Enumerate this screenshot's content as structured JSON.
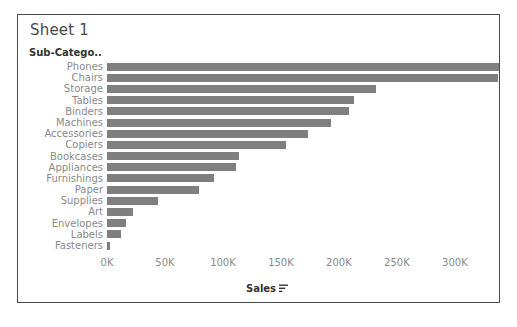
{
  "sheet": {
    "title": "Sheet 1"
  },
  "field_header": {
    "label": "Sub-Catego.."
  },
  "axis": {
    "x_title": "Sales",
    "x_sort_icon": "sort-descending-icon",
    "x_ticks": [
      "0K",
      "50K",
      "100K",
      "150K",
      "200K",
      "250K",
      "300K"
    ]
  },
  "colors": {
    "bar": "#7f7f7f",
    "frame": "#4a4a4a",
    "label": "#8a8a8a",
    "header": "#333333",
    "title": "#4a4a4a",
    "background": "#ffffff"
  },
  "chart_data": {
    "type": "bar",
    "orientation": "horizontal",
    "title": "Sheet 1",
    "xlabel": "Sales",
    "ylabel": "Sub-Catego..",
    "xlim": [
      0,
      338000
    ],
    "xtick_values": [
      0,
      50000,
      100000,
      150000,
      200000,
      250000,
      300000
    ],
    "xtick_labels": [
      "0K",
      "50K",
      "100K",
      "150K",
      "200K",
      "250K",
      "300K"
    ],
    "grid": false,
    "legend": false,
    "sort": "descending",
    "categories": [
      "Phones",
      "Chairs",
      "Storage",
      "Tables",
      "Binders",
      "Machines",
      "Accessories",
      "Copiers",
      "Bookcases",
      "Appliances",
      "Furnishings",
      "Paper",
      "Supplies",
      "Art",
      "Envelopes",
      "Labels",
      "Fasteners"
    ],
    "values": [
      338000,
      337000,
      232000,
      213000,
      209000,
      193000,
      173000,
      154000,
      114000,
      111000,
      92000,
      79000,
      44000,
      22000,
      16000,
      12000,
      3000
    ],
    "series": [
      {
        "name": "Sales",
        "values": [
          338000,
          337000,
          232000,
          213000,
          209000,
          193000,
          173000,
          154000,
          114000,
          111000,
          92000,
          79000,
          44000,
          22000,
          16000,
          12000,
          3000
        ]
      }
    ]
  }
}
